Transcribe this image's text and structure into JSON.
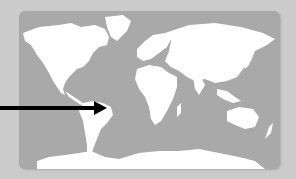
{
  "image": {
    "subject": "world-map",
    "description": "Grayscale world map with white landmasses on gray ocean, black arrow pointing to South America (Brazil)",
    "colors": {
      "background": "#cbcbcb",
      "ocean": "#a9a9a9",
      "land": "#ffffff",
      "arrow": "#000000"
    },
    "annotation": {
      "type": "arrow",
      "points_to": "South America"
    }
  }
}
